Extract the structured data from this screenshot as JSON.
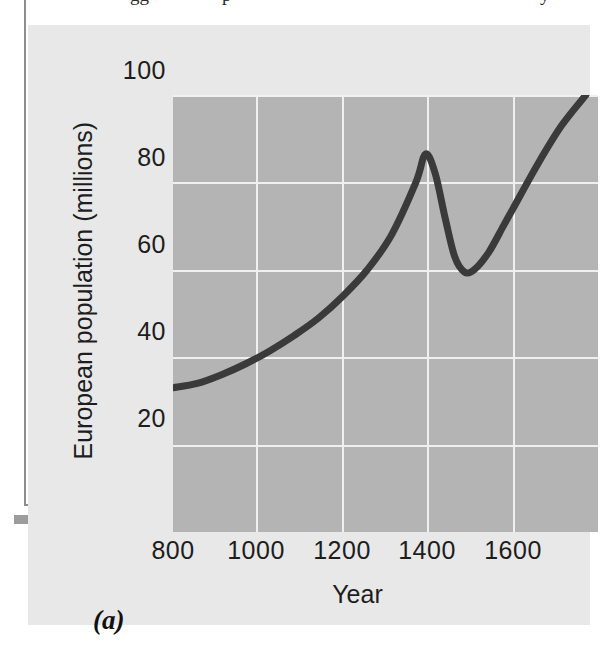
{
  "figure": {
    "panel_letter": "(a)",
    "background_color": "#e8e8e8",
    "plot_background_color": "#b4b4b4",
    "gridline_color": "#f0f0f0",
    "curve_color": "#3a3a3a"
  },
  "chart_data": {
    "type": "line",
    "title": "",
    "subtitle": "",
    "xlabel": "Year",
    "ylabel": "European population (millions)",
    "xlim": [
      800,
      1675
    ],
    "ylim": [
      0,
      100
    ],
    "xticks": [
      800,
      1000,
      1200,
      1400,
      1600
    ],
    "xticklabels": [
      "800",
      "1000",
      "1200",
      "1400",
      "1600"
    ],
    "yticks": [
      20,
      40,
      60,
      80,
      100
    ],
    "yticklabels": [
      "20",
      "40",
      "60",
      "80",
      "100"
    ],
    "grid": true,
    "legend": null,
    "legend_position": "none",
    "annotations": [],
    "series": [
      {
        "name": "European population",
        "x": [
          800,
          850,
          900,
          950,
          1000,
          1050,
          1100,
          1150,
          1200,
          1250,
          1300,
          1320,
          1340,
          1360,
          1380,
          1400,
          1420,
          1450,
          1480,
          1500,
          1550,
          1600,
          1650
        ],
        "y": [
          33,
          34,
          36,
          38.5,
          41.5,
          45,
          49,
          54,
          60,
          68,
          80,
          86.5,
          82,
          72,
          63,
          59.5,
          60,
          64,
          70,
          74,
          84,
          93,
          100
        ]
      }
    ]
  },
  "scan_artifacts": {
    "top_text_fragments": [
      "gg",
      "p",
      "y"
    ]
  }
}
